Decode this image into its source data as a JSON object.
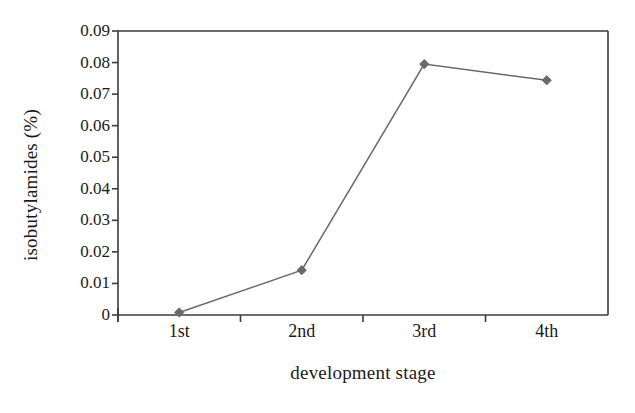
{
  "chart_data": {
    "type": "line",
    "title": "",
    "subtitle": "",
    "xlabel": "development stage",
    "ylabel": "isobutylamides (%)",
    "categories": [
      "1st",
      "2nd",
      "3rd",
      "4th"
    ],
    "values": [
      0.0008,
      0.0142,
      0.0795,
      0.0744
    ],
    "series": [
      {
        "name": "isobutylamides",
        "values": [
          0.0008,
          0.0142,
          0.0795,
          0.0744
        ],
        "color": "#696969",
        "marker": "diamond"
      }
    ],
    "ylim": [
      0,
      0.09
    ],
    "ytick_labels": [
      "0.09",
      "0.08",
      "0.07",
      "0.06",
      "0.05",
      "0.04",
      "0.03",
      "0.02",
      "0.01",
      "0"
    ],
    "ytick_values": [
      0.09,
      0.08,
      0.07,
      0.06,
      0.05,
      0.04,
      0.03,
      0.02,
      0.01,
      0
    ],
    "xtick_labels": [
      "1st",
      "2nd",
      "3rd",
      "4th"
    ],
    "grid": false,
    "legend": null,
    "legend_position": "none",
    "frame": "box",
    "line_color": "#696969",
    "axis_color": "#3b3b3b",
    "background": "#ffffff"
  },
  "axes": {
    "y_title": "isobutylamides (%)",
    "x_title": "development stage"
  }
}
